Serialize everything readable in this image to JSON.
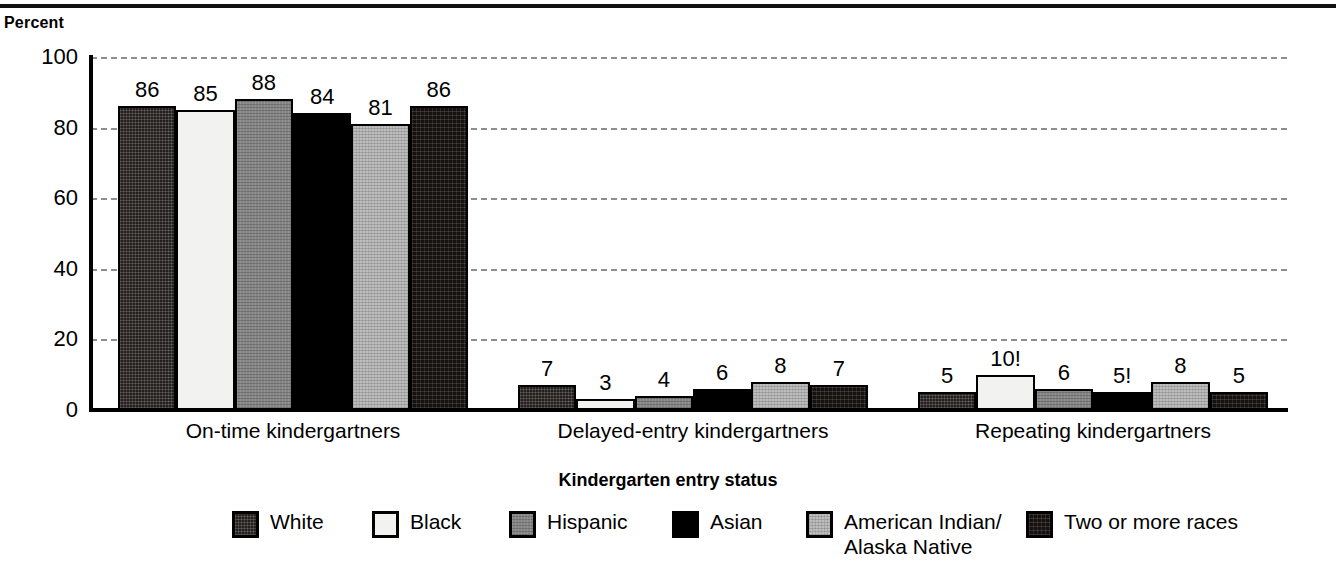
{
  "chart_data": {
    "type": "bar",
    "title": "",
    "subtitle": "",
    "ylabel": "Percent",
    "xlabel": "Kindergarten entry status",
    "ylim": [
      0,
      100
    ],
    "yticks": [
      0,
      20,
      40,
      60,
      80,
      100
    ],
    "grid": "horizontal-dashed",
    "legend_position": "bottom",
    "categories": [
      "On-time kindergartners",
      "Delayed-entry kindergartners",
      "Repeating kindergartners"
    ],
    "series": [
      {
        "name": "White",
        "values": [
          86,
          7,
          5
        ],
        "labels": [
          "86",
          "7",
          "5"
        ],
        "fill": "dark-dither"
      },
      {
        "name": "Black",
        "values": [
          85,
          3,
          10
        ],
        "labels": [
          "85",
          "3",
          "10!"
        ],
        "fill": "near-white"
      },
      {
        "name": "Hispanic",
        "values": [
          88,
          4,
          6
        ],
        "labels": [
          "88",
          "4",
          "6"
        ],
        "fill": "medium-gray-dither"
      },
      {
        "name": "Asian",
        "values": [
          84,
          6,
          5
        ],
        "labels": [
          "84",
          "6",
          "5!"
        ],
        "fill": "solid-black"
      },
      {
        "name": "American Indian/\nAlaska Native",
        "values": [
          81,
          8,
          8
        ],
        "labels": [
          "81",
          "8",
          "8"
        ],
        "fill": "light-gray-dither"
      },
      {
        "name": "Two or more races",
        "values": [
          86,
          7,
          5
        ],
        "labels": [
          "86",
          "7",
          "5"
        ],
        "fill": "darkest-dither"
      }
    ]
  },
  "axis": {
    "y_title": "Percent",
    "x_title": "Kindergarten entry status",
    "ticks": [
      "0",
      "20",
      "40",
      "60",
      "80",
      "100"
    ]
  },
  "groups": [
    {
      "label": "On-time kindergartners",
      "bars": [
        {
          "series": "White",
          "value": 86,
          "label": "86"
        },
        {
          "series": "Black",
          "value": 85,
          "label": "85"
        },
        {
          "series": "Hispanic",
          "value": 88,
          "label": "88"
        },
        {
          "series": "Asian",
          "value": 84,
          "label": "84"
        },
        {
          "series": "American Indian/Alaska Native",
          "value": 81,
          "label": "81"
        },
        {
          "series": "Two or more races",
          "value": 86,
          "label": "86"
        }
      ]
    },
    {
      "label": "Delayed-entry kindergartners",
      "bars": [
        {
          "series": "White",
          "value": 7,
          "label": "7"
        },
        {
          "series": "Black",
          "value": 3,
          "label": "3"
        },
        {
          "series": "Hispanic",
          "value": 4,
          "label": "4"
        },
        {
          "series": "Asian",
          "value": 6,
          "label": "6"
        },
        {
          "series": "American Indian/Alaska Native",
          "value": 8,
          "label": "8"
        },
        {
          "series": "Two or more races",
          "value": 7,
          "label": "7"
        }
      ]
    },
    {
      "label": "Repeating kindergartners",
      "bars": [
        {
          "series": "White",
          "value": 5,
          "label": "5"
        },
        {
          "series": "Black",
          "value": 10,
          "label": "10!"
        },
        {
          "series": "Hispanic",
          "value": 6,
          "label": "6"
        },
        {
          "series": "Asian",
          "value": 5,
          "label": "5!"
        },
        {
          "series": "American Indian/Alaska Native",
          "value": 8,
          "label": "8"
        },
        {
          "series": "Two or more races",
          "value": 5,
          "label": "5"
        }
      ]
    }
  ],
  "legend": [
    {
      "label": "White",
      "fill": "dark-dither"
    },
    {
      "label": "Black",
      "fill": "near-white"
    },
    {
      "label": "Hispanic",
      "fill": "medium-gray-dither"
    },
    {
      "label": "Asian",
      "fill": "solid-black"
    },
    {
      "label": "American Indian/\nAlaska Native",
      "fill": "light-gray-dither"
    },
    {
      "label": "Two or more races",
      "fill": "darkest-dither"
    }
  ],
  "colors": {
    "dark_dither": "#241f1c",
    "near_white": "#f2f2f0",
    "medium_gray": "#858585",
    "solid_black": "#000000",
    "light_gray": "#bdbdbd",
    "darkest_dither": "#16110f",
    "axis": "#000000",
    "gridline": "#8e8e8e"
  }
}
